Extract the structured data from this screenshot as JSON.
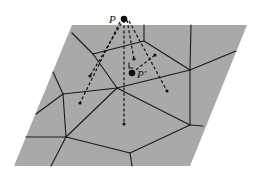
{
  "diagram": {
    "type": "voronoi-projection",
    "colors": {
      "plane": "#a9a9a9",
      "lines": "#1a1a1a",
      "background": "#ffffff"
    },
    "labels": {
      "P": "P",
      "P_prime": "P'"
    },
    "plane_corners": [
      [
        72,
        25
      ],
      [
        247,
        25
      ],
      [
        190,
        166
      ],
      [
        14,
        166
      ]
    ],
    "point_P": [
      124,
      19
    ],
    "point_P_prime": [
      132,
      73
    ],
    "sites": [
      [
        90,
        76
      ],
      [
        80,
        103
      ],
      [
        134,
        59
      ],
      [
        155,
        55
      ],
      [
        167,
        91
      ],
      [
        124,
        124
      ]
    ],
    "voronoi_vertices": {
      "A": [
        93,
        54
      ],
      "B": [
        144,
        41
      ],
      "C": [
        190,
        70
      ],
      "D": [
        117,
        88
      ],
      "E": [
        63,
        94
      ],
      "F": [
        66,
        137
      ],
      "G": [
        130,
        153
      ],
      "H": [
        190,
        125
      ]
    }
  }
}
